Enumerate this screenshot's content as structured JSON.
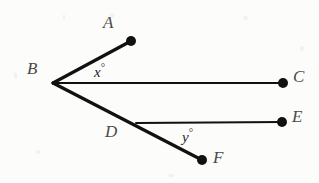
{
  "figure": {
    "background_color": "#fcfcfb",
    "stroke_color": "#111111",
    "label_color": "#4a4a4a",
    "angle_label_color": "#1f1f1f",
    "points": [
      {
        "id": "A",
        "label": "A",
        "x": 131,
        "y": 41,
        "has_dot": true,
        "label_x": 103,
        "label_y": 14
      },
      {
        "id": "B",
        "label": "B",
        "x": 53,
        "y": 83,
        "has_dot": false,
        "label_x": 27,
        "label_y": 60
      },
      {
        "id": "C",
        "label": "C",
        "x": 283,
        "y": 83,
        "has_dot": true,
        "label_x": 293,
        "label_y": 68
      },
      {
        "id": "D",
        "label": "D",
        "x": 136,
        "y": 123,
        "has_dot": false,
        "label_x": 105,
        "label_y": 123
      },
      {
        "id": "E",
        "label": "E",
        "x": 282,
        "y": 122,
        "has_dot": true,
        "label_x": 292,
        "label_y": 108
      },
      {
        "id": "F",
        "label": "F",
        "x": 202,
        "y": 160,
        "has_dot": true,
        "label_x": 213,
        "label_y": 149
      }
    ],
    "segments": [
      {
        "id": "BA",
        "from": "B",
        "to": "A",
        "width": 3.2
      },
      {
        "id": "BC",
        "from": "B",
        "to": "C",
        "width": 2.0
      },
      {
        "id": "BF",
        "from": "B",
        "to": "F",
        "width": 3.2
      },
      {
        "id": "DE",
        "from": "D",
        "to": "E",
        "width": 2.0
      }
    ],
    "angles": [
      {
        "id": "x",
        "label": "x",
        "degree_symbol": "°",
        "vertex": "B",
        "rays": [
          "A",
          "C"
        ],
        "label_x": 94,
        "label_y": 62
      },
      {
        "id": "y",
        "label": "y",
        "degree_symbol": "°",
        "vertex": "D",
        "rays": [
          "E",
          "F"
        ],
        "label_x": 182,
        "label_y": 127
      }
    ],
    "dot_radius": 5
  }
}
